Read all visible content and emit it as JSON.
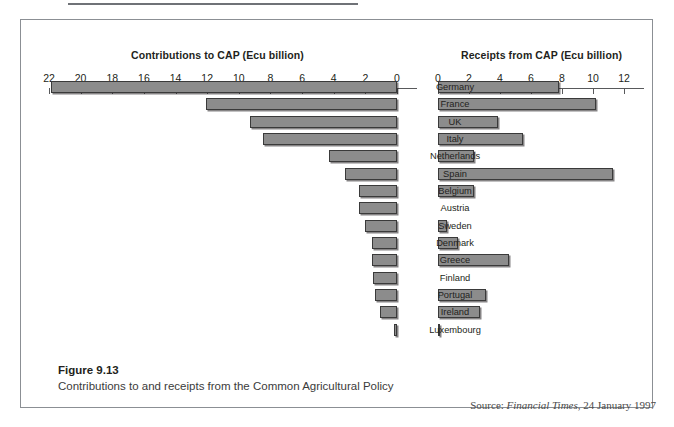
{
  "figure": {
    "caption_title": "Figure 9.13",
    "caption_text": "Contributions to and receipts from the Common Agricultural Policy",
    "source_prefix": "Source:",
    "source_publication": "Financial Times",
    "source_rest": ", 24 January 1997"
  },
  "chart_data": {
    "type": "bar",
    "title": "Contributions to and receipts from the Common Agricultural Policy",
    "orientation": "horizontal-bidirectional",
    "left_axis": {
      "label": "Contributions to CAP (Ecu billion)",
      "ticks": [
        22,
        20,
        18,
        16,
        14,
        12,
        10,
        8,
        6,
        4,
        2,
        0
      ],
      "range": [
        22,
        0
      ],
      "direction": "right-to-left"
    },
    "right_axis": {
      "label": "Receipts from CAP (Ecu billion)",
      "ticks": [
        0,
        2,
        4,
        6,
        8,
        10,
        12
      ],
      "range": [
        0,
        12
      ],
      "direction": "left-to-right"
    },
    "categories": [
      "Germany",
      "France",
      "UK",
      "Italy",
      "Netherlands",
      "Spain",
      "Belgium",
      "Austria",
      "Sweden",
      "Denmark",
      "Greece",
      "Finland",
      "Portugal",
      "Ireland",
      "Luxembourg"
    ],
    "series": [
      {
        "name": "Contributions to CAP (Ecu billion)",
        "values": [
          21.9,
          12.1,
          9.3,
          8.5,
          4.3,
          3.3,
          2.4,
          2.4,
          2.0,
          1.6,
          1.6,
          1.5,
          1.4,
          1.1,
          0.2
        ]
      },
      {
        "name": "Receipts from CAP (Ecu billion)",
        "values": [
          7.8,
          10.2,
          3.9,
          5.5,
          2.3,
          11.3,
          2.3,
          0.0,
          0.6,
          1.3,
          4.6,
          0.0,
          3.1,
          2.7,
          0.1
        ]
      }
    ],
    "grid": false,
    "legend": "none",
    "bar_fill_color": "#8c8c8c",
    "bar_border_color": "#3a3a3a"
  }
}
